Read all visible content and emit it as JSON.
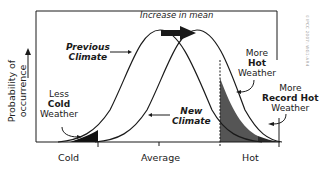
{
  "diagram": {
    "y_axis_label": "Probability of occurrence",
    "x_axis_categories": [
      "Cold",
      "Average",
      "Hot"
    ],
    "top_annotation": "Increase in mean",
    "labels": {
      "previous_climate": [
        "Previous",
        "Climate"
      ],
      "new_climate": [
        "New",
        "Climate"
      ],
      "less_cold": [
        "Less",
        "Cold",
        "Weather"
      ],
      "more_hot": [
        "More",
        "Hot",
        "Weather"
      ],
      "more_record_hot": [
        "More",
        "Record Hot",
        "Weather"
      ]
    },
    "credit": "©IPCC 2007: WG1-AR4",
    "colors": {
      "line": "#1a1a1a",
      "hot_fill": "#555555",
      "record_hot_fill": "#2a2a2a",
      "cold_fill": "#111111"
    }
  }
}
